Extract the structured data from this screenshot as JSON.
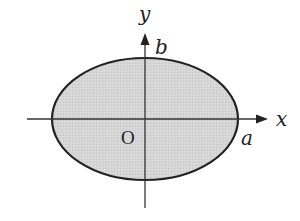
{
  "diagram": {
    "labels": {
      "y_axis": "y",
      "x_axis": "x",
      "semi_minor": "b",
      "semi_major": "a",
      "origin": "O"
    },
    "colors": {
      "fill": "#d4d4d4",
      "stroke": "#222222",
      "axis": "#333333"
    }
  }
}
